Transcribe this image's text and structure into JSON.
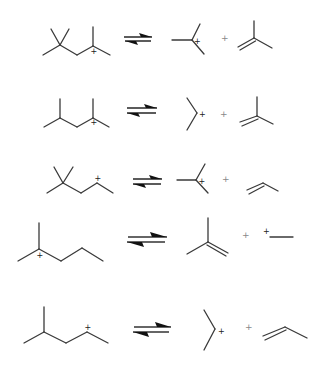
{
  "charge_symbol": "+",
  "plus_symbol": "+",
  "reactions": [
    {
      "reactant": "2,4,4-trimethylpent-2-yl cation",
      "products": [
        "tert-butyl cation",
        "isobutene"
      ],
      "arrow": "equilibrium"
    },
    {
      "reactant": "2,4-dimethylpent-2-yl cation",
      "products": [
        "isopropyl cation",
        "isobutene"
      ],
      "arrow": "equilibrium"
    },
    {
      "reactant": "4,4-dimethylpent-2-yl cation",
      "products": [
        "tert-butyl cation",
        "propene"
      ],
      "arrow": "equilibrium"
    },
    {
      "reactant": "2-methylhex-2-yl cation",
      "products": [
        "isobutene",
        "ethyl cation"
      ],
      "arrow": "equilibrium"
    },
    {
      "reactant": "4-methylpent-2-yl cation",
      "products": [
        "isopropyl cation",
        "propene"
      ],
      "arrow": "equilibrium"
    }
  ]
}
